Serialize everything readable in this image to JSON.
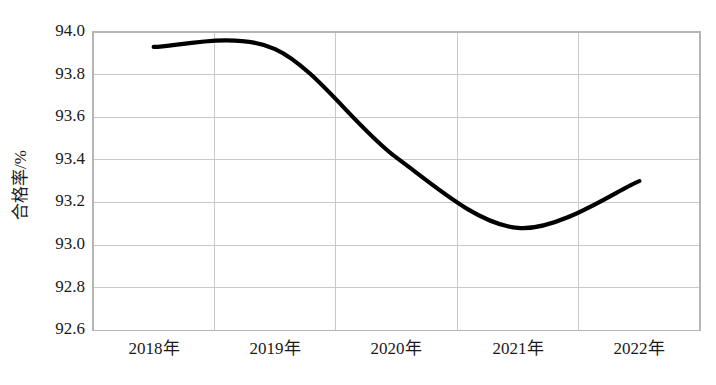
{
  "chart_data": {
    "type": "line",
    "title": "",
    "subtitle": "",
    "xlabel": "",
    "ylabel": "合格率/%",
    "categories": [
      "2018年",
      "2019年",
      "2020年",
      "2021年",
      "2022年"
    ],
    "values": [
      93.93,
      93.92,
      93.41,
      93.08,
      93.3
    ],
    "series": [
      {
        "name": "合格率",
        "values": [
          93.93,
          93.92,
          93.41,
          93.08,
          93.3
        ],
        "color": "#000000"
      }
    ],
    "ylim": [
      92.6,
      94.0
    ],
    "ytick_labels": [
      "94.0",
      "93.8",
      "93.6",
      "93.4",
      "93.2",
      "93.0",
      "92.8",
      "92.6"
    ],
    "ytick_values": [
      94.0,
      93.8,
      93.6,
      93.4,
      93.2,
      93.0,
      92.8,
      92.6
    ],
    "grid": {
      "horizontal": true,
      "vertical": true,
      "color": "#c9c9c9"
    },
    "legend": {
      "visible": false,
      "position": "none",
      "entries": []
    },
    "smoothing": "spline",
    "line_width": 4.2,
    "markers": false,
    "plot_background": "#ffffff"
  },
  "ytick_labels": {
    "t0": "94.0",
    "t1": "93.8",
    "t2": "93.6",
    "t3": "93.4",
    "t4": "93.2",
    "t5": "93.0",
    "t6": "92.8",
    "t7": "92.6"
  },
  "xtick_labels": {
    "t0": "2018年",
    "t1": "2019年",
    "t2": "2020年",
    "t3": "2021年",
    "t4": "2022年"
  },
  "axis_titles": {
    "y": "合格率/%"
  }
}
